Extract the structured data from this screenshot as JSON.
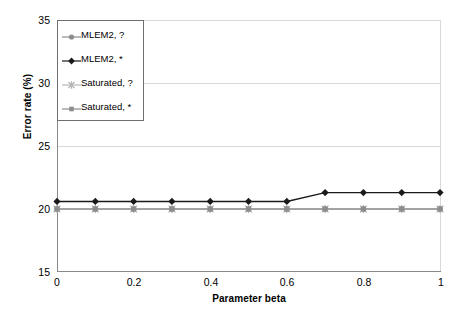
{
  "chart_data": {
    "type": "line",
    "title": "",
    "xlabel": "Parameter beta",
    "ylabel": "Error rate (%)",
    "xlim": [
      0,
      1
    ],
    "ylim": [
      15,
      35
    ],
    "xticks": [
      "0",
      "0.2",
      "0.4",
      "0.6",
      "0.8",
      "1"
    ],
    "xtick_values": [
      0,
      0.2,
      0.4,
      0.6,
      0.8,
      1
    ],
    "yticks": [
      "15",
      "20",
      "25",
      "30",
      "35"
    ],
    "ytick_values": [
      15,
      20,
      25,
      30,
      35
    ],
    "grid": true,
    "legend_position": "upper-left",
    "x": [
      0,
      0.1,
      0.2,
      0.3,
      0.4,
      0.5,
      0.6,
      0.7,
      0.8,
      0.9,
      1
    ],
    "series": [
      {
        "name": "MLEM2, ?",
        "marker": "circle",
        "color": "#8c8c8c",
        "values": [
          20.0,
          20.0,
          20.0,
          20.0,
          20.0,
          20.0,
          20.0,
          20.0,
          20.0,
          20.0,
          20.0
        ]
      },
      {
        "name": "MLEM2, *",
        "marker": "diamond",
        "color": "#1a1a1a",
        "values": [
          20.6,
          20.6,
          20.6,
          20.6,
          20.6,
          20.6,
          20.6,
          21.3,
          21.3,
          21.3,
          21.3
        ]
      },
      {
        "name": "Saturated, ?",
        "marker": "star",
        "color": "#b5b5b5",
        "values": [
          20.0,
          20.0,
          20.0,
          20.0,
          20.0,
          20.0,
          20.0,
          20.0,
          20.0,
          20.0,
          20.0
        ]
      },
      {
        "name": "Saturated, *",
        "marker": "square",
        "color": "#8c8c8c",
        "values": [
          20.0,
          20.0,
          20.0,
          20.0,
          20.0,
          20.0,
          20.0,
          20.0,
          20.0,
          20.0,
          20.0
        ]
      }
    ]
  },
  "colors": {
    "background": "#ffffff",
    "axis": "#8a8a8a",
    "grid": "#d9d9d9",
    "legend_border": "#6f6f6f",
    "text": "#000000"
  }
}
